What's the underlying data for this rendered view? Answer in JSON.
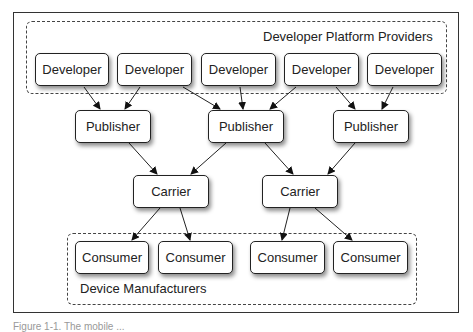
{
  "diagram": {
    "groups": {
      "top": {
        "label": "Developer Platform Providers"
      },
      "bottom": {
        "label": "Device Manufacturers"
      }
    },
    "developers": [
      {
        "label": "Developer"
      },
      {
        "label": "Developer"
      },
      {
        "label": "Developer"
      },
      {
        "label": "Developer"
      },
      {
        "label": "Developer"
      }
    ],
    "publishers": [
      {
        "label": "Publisher"
      },
      {
        "label": "Publisher"
      },
      {
        "label": "Publisher"
      }
    ],
    "carriers": [
      {
        "label": "Carrier"
      },
      {
        "label": "Carrier"
      }
    ],
    "consumers": [
      {
        "label": "Consumer"
      },
      {
        "label": "Consumer"
      },
      {
        "label": "Consumer"
      },
      {
        "label": "Consumer"
      }
    ],
    "edges": [
      {
        "from": "Developer 1",
        "to": "Publisher 1"
      },
      {
        "from": "Developer 2",
        "to": "Publisher 1"
      },
      {
        "from": "Developer 2",
        "to": "Publisher 2"
      },
      {
        "from": "Developer 3",
        "to": "Publisher 2"
      },
      {
        "from": "Developer 4",
        "to": "Publisher 2"
      },
      {
        "from": "Developer 4",
        "to": "Publisher 3"
      },
      {
        "from": "Developer 5",
        "to": "Publisher 3"
      },
      {
        "from": "Publisher 1",
        "to": "Carrier 1"
      },
      {
        "from": "Publisher 2",
        "to": "Carrier 1"
      },
      {
        "from": "Publisher 2",
        "to": "Carrier 2"
      },
      {
        "from": "Publisher 3",
        "to": "Carrier 2"
      },
      {
        "from": "Carrier 1",
        "to": "Consumer 1"
      },
      {
        "from": "Carrier 1",
        "to": "Consumer 2"
      },
      {
        "from": "Carrier 2",
        "to": "Consumer 3"
      },
      {
        "from": "Carrier 2",
        "to": "Consumer 4"
      }
    ]
  },
  "caption": {
    "text": "Figure 1-1. The mobile ..."
  }
}
